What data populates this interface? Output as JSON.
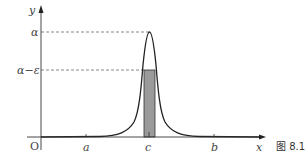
{
  "figure": {
    "caption": "图 8.1",
    "axes": {
      "x_label": "x",
      "y_label": "y",
      "origin_label": "O"
    },
    "y_ticks": [
      {
        "label": "α",
        "y": 32
      },
      {
        "label": "α−ε",
        "y": 70
      }
    ],
    "x_ticks": [
      {
        "label": "a",
        "x": 86
      },
      {
        "label": "c",
        "x": 149
      },
      {
        "label": "b",
        "x": 214
      }
    ],
    "curve": {
      "description": "sharp peaked function centered at c reaching α",
      "peak_x": 149,
      "peak_y": 32
    },
    "shaded_region": {
      "description": "rectangle of height α−ε over narrow interval around c",
      "color": "#9a9a9a"
    }
  }
}
